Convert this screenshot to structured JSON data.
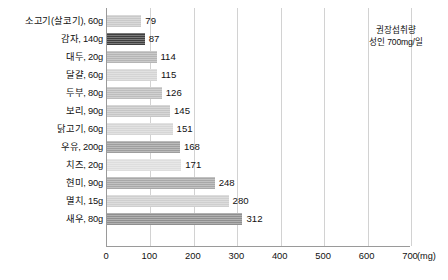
{
  "chart_data": {
    "type": "bar",
    "orientation": "horizontal",
    "title": "",
    "xlabel": "(mg)",
    "ylabel": "",
    "xlim": [
      0,
      700
    ],
    "xticks": [
      0,
      100,
      200,
      300,
      400,
      500,
      600,
      700
    ],
    "xtick_labels": [
      "0",
      "100",
      "200",
      "300",
      "400",
      "500",
      "600",
      "700"
    ],
    "unit_label": "(mg)",
    "grid": true,
    "grid_axis": "x",
    "legend": "none",
    "categories": [
      "소고기(살코기), 60g",
      "감자, 140g",
      "대두, 20g",
      "달걀, 60g",
      "두부, 80g",
      "보리, 90g",
      "닭고기, 60g",
      "우유, 200g",
      "치즈, 20g",
      "현미, 90g",
      "멸치, 15g",
      "새우, 80g"
    ],
    "values": [
      79,
      87,
      114,
      115,
      126,
      145,
      151,
      168,
      171,
      248,
      280,
      312
    ],
    "bar_colors": [
      "#c9c9c9",
      "#3f3f3f",
      "#b5b5b5",
      "#d4d4d4",
      "#bdbdbd",
      "#c6c6c6",
      "#d6d6d6",
      "#9e9e9e",
      "#dedede",
      "#a8a8a8",
      "#cfcfcf",
      "#8f8f8f"
    ],
    "annotations": [
      {
        "line1": "권장섭취량",
        "line2": "성인 700mg/일",
        "at_value": 700
      }
    ]
  },
  "annotation": {
    "line1": "권장섭취량",
    "line2": "성인 700mg/일"
  },
  "axis": {
    "unit": "(mg)"
  },
  "colors": {
    "gridline": "#d2d2d2",
    "axis": "#9a9a9a",
    "text": "#111111",
    "background": "#ffffff"
  }
}
